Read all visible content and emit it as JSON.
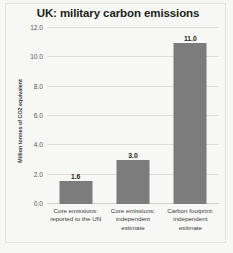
{
  "chart_data": {
    "type": "bar",
    "title": "UK: military carbon emissions",
    "xlabel": "",
    "ylabel": "Million tonnes of CO2 equivalent",
    "categories": [
      "Core emissions: reported to the UN",
      "Core emissions: independent estimate",
      "Carbon footprint: independent estimate"
    ],
    "category_lines": [
      [
        "Core emissions:",
        "reported to the UN"
      ],
      [
        "Core emissions:",
        "independent",
        "estimate"
      ],
      [
        "Carbon footprint:",
        "independent",
        "estimate"
      ]
    ],
    "values": [
      1.6,
      3.0,
      11.0
    ],
    "value_labels": [
      "1.6",
      "3.0",
      "11.0"
    ],
    "ylim": [
      0,
      12
    ],
    "yticks": [
      0,
      2,
      4,
      6,
      8,
      10,
      12
    ],
    "ytick_labels": [
      "0.0",
      "2.0",
      "4.0",
      "6.0",
      "8.0",
      "10.0",
      "12.0"
    ],
    "grid": true,
    "legend": false,
    "bar_color": "#7c7c7c",
    "grid_color": "#dededa",
    "background_color": "#f7f7f5",
    "text_color": "#231f20"
  }
}
